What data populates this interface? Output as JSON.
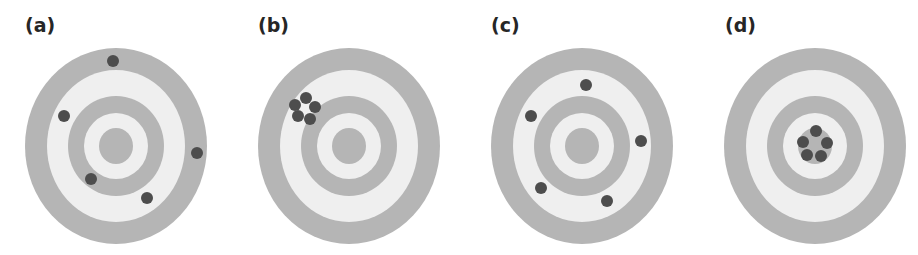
{
  "colors": {
    "ring_gray": "#b5b5b5",
    "ring_light": "#efefef",
    "shot": "#4d4d4d",
    "label": "#262626"
  },
  "target_geometry": {
    "radii_x": [
      91,
      69,
      48,
      32,
      17
    ],
    "radii_y": [
      98,
      76,
      50,
      33,
      18
    ],
    "ring_fills": [
      "gray",
      "light",
      "gray",
      "light",
      "gray"
    ],
    "shot_radius": 6
  },
  "panels": [
    {
      "label": "(a)",
      "label_x": 25,
      "center": [
        116,
        146
      ],
      "shots": [
        [
          113,
          61
        ],
        [
          64,
          116
        ],
        [
          197,
          153
        ],
        [
          91,
          179
        ],
        [
          147,
          198
        ]
      ]
    },
    {
      "label": "(b)",
      "label_x": 258,
      "center": [
        349,
        146
      ],
      "shots": [
        [
          306,
          98
        ],
        [
          315,
          107
        ],
        [
          310,
          119
        ],
        [
          298,
          116
        ],
        [
          295,
          105
        ]
      ]
    },
    {
      "label": "(c)",
      "label_x": 491,
      "center": [
        582,
        146
      ],
      "shots": [
        [
          586,
          85
        ],
        [
          531,
          116
        ],
        [
          641,
          141
        ],
        [
          541,
          188
        ],
        [
          607,
          201
        ]
      ]
    },
    {
      "label": "(d)",
      "label_x": 725,
      "center": [
        815,
        146
      ],
      "shots": [
        [
          816,
          131
        ],
        [
          827,
          143
        ],
        [
          821,
          156
        ],
        [
          807,
          155
        ],
        [
          803,
          142
        ]
      ]
    }
  ]
}
